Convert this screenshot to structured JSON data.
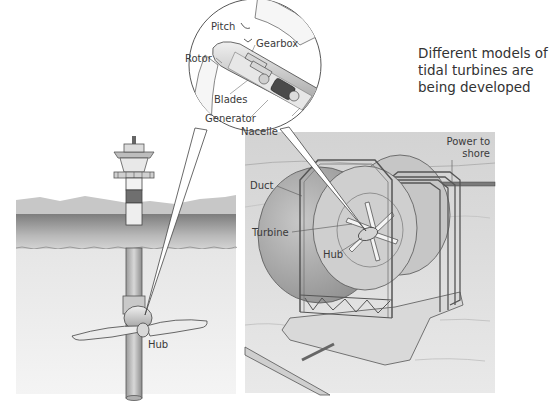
{
  "caption": {
    "lines": [
      "Different models of",
      "tidal turbines are",
      "being developed"
    ]
  },
  "inset": {
    "labels": {
      "pitch": "Pitch",
      "gearbox": "Gearbox",
      "rotor": "Rotor",
      "blades": "Blades",
      "generator": "Generator",
      "nacelle": "Nacelle"
    }
  },
  "left_turbine": {
    "labels": {
      "hub": "Hub"
    }
  },
  "right_turbine": {
    "labels": {
      "power_to_shore_line1": "Power to",
      "power_to_shore_line2": "shore",
      "duct": "Duct",
      "turbine": "Turbine",
      "hub": "Hub"
    }
  },
  "colors": {
    "sky_hill": "#c9c9c9",
    "sea_surface_dark": "#8a8a8a",
    "water_light": "#e4e4e4",
    "right_panel_bg": "#dcdcdc",
    "line": "#3a3a3a"
  }
}
